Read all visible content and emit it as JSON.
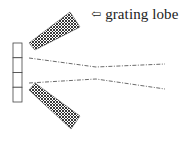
{
  "diagram": {
    "label": {
      "arrow_icon": "⇦",
      "text": "grating lobe"
    },
    "array": {
      "element_count": 4,
      "x": 13,
      "y": 43,
      "width": 9,
      "cell_height": 14.75
    },
    "lobes": [
      {
        "name": "upper-grating-lobe",
        "points": "29,43 70,12 80,27 35,50"
      },
      {
        "name": "lower-grating-lobe",
        "points": "29,90 35,83 80,116 71,129"
      }
    ],
    "main_beam": {
      "upper_line": "29,58 96,67 165,64",
      "lower_line": "29,83 96,79 165,89"
    },
    "colors": {
      "stroke": "#333333",
      "hatch": "#222222",
      "background": "#ffffff"
    }
  }
}
